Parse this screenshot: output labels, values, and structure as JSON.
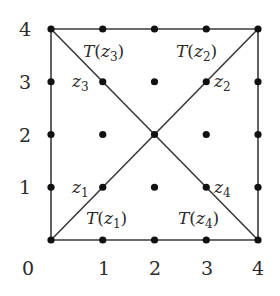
{
  "diagram": {
    "title": "",
    "grid": {
      "size": 4,
      "origin_px": [
        51,
        240
      ],
      "step_x_px": 51.75,
      "step_y_px": 52.75
    },
    "x_axis_labels": [
      "0",
      "1",
      "2",
      "3",
      "4"
    ],
    "y_axis_labels": [
      "1",
      "2",
      "3",
      "4"
    ],
    "lattice_points": [
      [
        0,
        0
      ],
      [
        1,
        0
      ],
      [
        2,
        0
      ],
      [
        3,
        0
      ],
      [
        4,
        0
      ],
      [
        0,
        1
      ],
      [
        1,
        1
      ],
      [
        2,
        1
      ],
      [
        3,
        1
      ],
      [
        4,
        1
      ],
      [
        0,
        2
      ],
      [
        1,
        2
      ],
      [
        2,
        2
      ],
      [
        3,
        2
      ],
      [
        4,
        2
      ],
      [
        0,
        3
      ],
      [
        1,
        3
      ],
      [
        2,
        3
      ],
      [
        3,
        3
      ],
      [
        4,
        3
      ],
      [
        0,
        4
      ],
      [
        1,
        4
      ],
      [
        2,
        4
      ],
      [
        3,
        4
      ],
      [
        4,
        4
      ]
    ],
    "edges": [
      {
        "name": "bottom-edge",
        "from": [
          0,
          0
        ],
        "to": [
          4,
          0
        ]
      },
      {
        "name": "top-edge",
        "from": [
          0,
          4
        ],
        "to": [
          4,
          4
        ]
      },
      {
        "name": "left-edge",
        "from": [
          0,
          0
        ],
        "to": [
          0,
          4
        ]
      },
      {
        "name": "right-edge",
        "from": [
          4,
          0
        ],
        "to": [
          4,
          4
        ]
      },
      {
        "name": "diagonal-main",
        "from": [
          0,
          0
        ],
        "to": [
          4,
          4
        ]
      },
      {
        "name": "diagonal-anti",
        "from": [
          0,
          4
        ],
        "to": [
          4,
          0
        ]
      }
    ],
    "points": [
      {
        "id": "z1",
        "symbol": "z",
        "subscript": "1",
        "coord": [
          1,
          1
        ]
      },
      {
        "id": "z2",
        "symbol": "z",
        "subscript": "2",
        "coord": [
          3,
          3
        ]
      },
      {
        "id": "z3",
        "symbol": "z",
        "subscript": "3",
        "coord": [
          1,
          3
        ]
      },
      {
        "id": "z4",
        "symbol": "z",
        "subscript": "4",
        "coord": [
          3,
          1
        ]
      }
    ],
    "transform_labels": [
      {
        "id": "T-z1",
        "func": "T",
        "open": "(",
        "symbol": "z",
        "subscript": "1",
        "close": ")"
      },
      {
        "id": "T-z2",
        "func": "T",
        "open": "(",
        "symbol": "z",
        "subscript": "2",
        "close": ")"
      },
      {
        "id": "T-z3",
        "func": "T",
        "open": "(",
        "symbol": "z",
        "subscript": "3",
        "close": ")"
      },
      {
        "id": "T-z4",
        "func": "T",
        "open": "(",
        "symbol": "z",
        "subscript": "4",
        "close": ")"
      }
    ],
    "colors": {
      "background": "#ffffff",
      "line": "#3a3a3a",
      "dot": "#111111",
      "text": "#2a2a2a"
    }
  }
}
